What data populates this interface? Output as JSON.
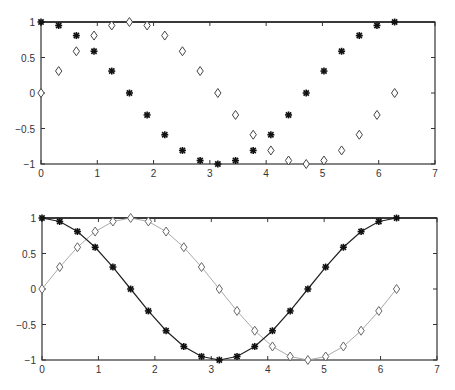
{
  "chart_data": [
    {
      "type": "scatter",
      "title": "",
      "xlabel": "",
      "ylabel": "",
      "xlim": [
        0,
        7
      ],
      "ylim": [
        -1,
        1
      ],
      "grid": false,
      "legend": null,
      "xticks": [
        "0",
        "1",
        "2",
        "3",
        "4",
        "5",
        "6",
        "7"
      ],
      "yticks": [
        "-1",
        "-0.5",
        "0",
        "0.5",
        "1"
      ],
      "x": [
        0,
        0.314,
        0.628,
        0.942,
        1.257,
        1.571,
        1.885,
        2.199,
        2.513,
        2.827,
        3.142,
        3.456,
        3.77,
        4.084,
        4.398,
        4.712,
        5.027,
        5.341,
        5.655,
        5.969,
        6.283
      ],
      "series": [
        {
          "name": "cos(x)",
          "marker": "asterisk",
          "line": "none",
          "color": "#222222",
          "values": [
            1.0,
            0.951,
            0.809,
            0.588,
            0.309,
            0.0,
            -0.309,
            -0.588,
            -0.809,
            -0.951,
            -1.0,
            -0.951,
            -0.809,
            -0.588,
            -0.309,
            0.0,
            0.309,
            0.588,
            0.809,
            0.951,
            1.0
          ]
        },
        {
          "name": "sin(x)",
          "marker": "diamond",
          "line": "none",
          "color": "#555555",
          "values": [
            0.0,
            0.309,
            0.588,
            0.809,
            0.951,
            1.0,
            0.951,
            0.809,
            0.588,
            0.309,
            0.0,
            -0.309,
            -0.588,
            -0.809,
            -0.951,
            -1.0,
            -0.951,
            -0.809,
            -0.588,
            -0.309,
            0.0
          ]
        }
      ]
    },
    {
      "type": "line",
      "title": "",
      "xlabel": "",
      "ylabel": "",
      "xlim": [
        0,
        7
      ],
      "ylim": [
        -1,
        1
      ],
      "grid": false,
      "legend": null,
      "xticks": [
        "0",
        "1",
        "2",
        "3",
        "4",
        "5",
        "6",
        "7"
      ],
      "yticks": [
        "-1",
        "-0.5",
        "0",
        "0.5",
        "1"
      ],
      "x": [
        0,
        0.314,
        0.628,
        0.942,
        1.257,
        1.571,
        1.885,
        2.199,
        2.513,
        2.827,
        3.142,
        3.456,
        3.77,
        4.084,
        4.398,
        4.712,
        5.027,
        5.341,
        5.655,
        5.969,
        6.283
      ],
      "series": [
        {
          "name": "cos(x)",
          "marker": "asterisk",
          "line": "solid",
          "color": "#222222",
          "values": [
            1.0,
            0.951,
            0.809,
            0.588,
            0.309,
            0.0,
            -0.309,
            -0.588,
            -0.809,
            -0.951,
            -1.0,
            -0.951,
            -0.809,
            -0.588,
            -0.309,
            0.0,
            0.309,
            0.588,
            0.809,
            0.951,
            1.0
          ]
        },
        {
          "name": "sin(x)",
          "marker": "diamond",
          "line": "solid",
          "color": "#aaaaaa",
          "values": [
            0.0,
            0.309,
            0.588,
            0.809,
            0.951,
            1.0,
            0.951,
            0.809,
            0.588,
            0.309,
            0.0,
            -0.309,
            -0.588,
            -0.809,
            -0.951,
            -1.0,
            -0.951,
            -0.809,
            -0.588,
            -0.309,
            0.0
          ]
        }
      ]
    }
  ],
  "layout": {
    "plots": [
      {
        "left": 41,
        "top": 22,
        "right": 435,
        "bottom": 164
      },
      {
        "left": 42,
        "top": 218,
        "right": 437,
        "bottom": 360
      }
    ]
  }
}
